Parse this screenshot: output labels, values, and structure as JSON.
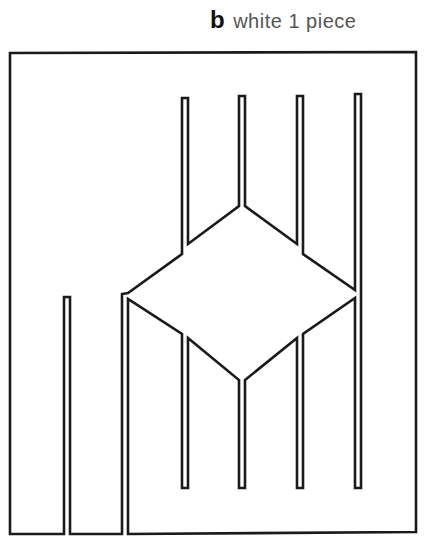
{
  "caption": {
    "letter": "b",
    "text": "white 1 piece"
  },
  "figure": {
    "stroke_color": "#1a1a1a",
    "background": "#ffffff"
  }
}
